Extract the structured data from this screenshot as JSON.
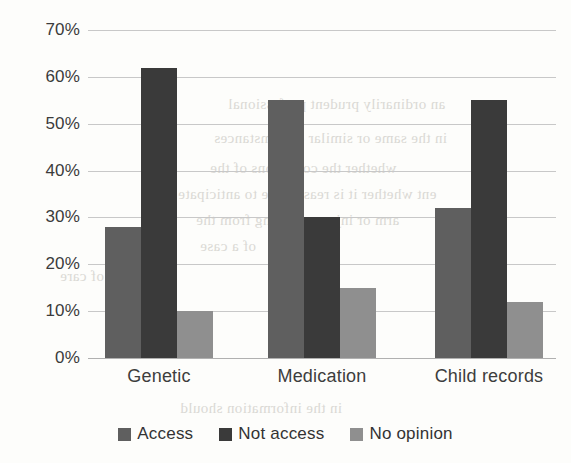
{
  "chart_data": {
    "type": "bar",
    "title": "",
    "subtitle": "",
    "xlabel": "",
    "ylabel": "",
    "categories": [
      "Genetic",
      "Medication",
      "Child records"
    ],
    "series": [
      {
        "name": "Access",
        "color": "#5f5f5f",
        "values": [
          28,
          55,
          32
        ]
      },
      {
        "name": "Not access",
        "color": "#3a3a3a",
        "values": [
          62,
          30,
          55
        ]
      },
      {
        "name": "No opinion",
        "color": "#8f8f8f",
        "values": [
          10,
          15,
          12
        ]
      }
    ],
    "ylim": [
      0,
      70
    ],
    "ytick_labels": [
      "0%",
      "10%",
      "20%",
      "30%",
      "40%",
      "50%",
      "60%",
      "70%"
    ],
    "ytick_values": [
      0,
      10,
      20,
      30,
      40,
      50,
      60,
      70
    ],
    "grid": true,
    "legend_position": "bottom"
  },
  "background": {
    "bleed_text": [
      {
        "text": "an ordinarily prudent professional",
        "x": 228,
        "y": 96
      },
      {
        "text": "in the same or similar circumstances",
        "x": 214,
        "y": 130
      },
      {
        "text": "whether the conditions of the",
        "x": 210,
        "y": 160
      },
      {
        "text": "ent whether it is reasonable to anticipate",
        "x": 178,
        "y": 186
      },
      {
        "text": "arm or injury resulting from the",
        "x": 196,
        "y": 212
      },
      {
        "text": "of a case",
        "x": 200,
        "y": 238
      },
      {
        "text": "in the information should",
        "x": 180,
        "y": 400
      },
      {
        "text": "standards of care",
        "x": 60,
        "y": 268
      }
    ]
  }
}
